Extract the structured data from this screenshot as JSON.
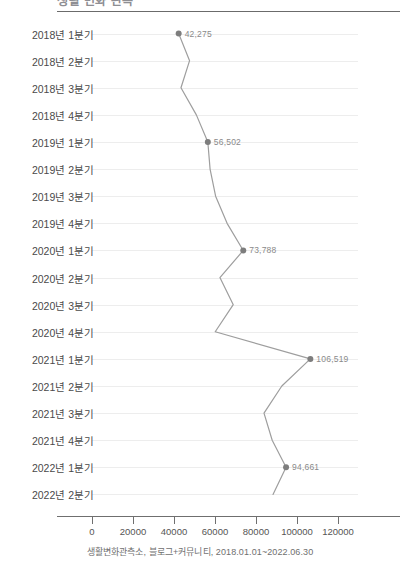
{
  "header": {
    "title": "생활 변화 관측",
    "rule_color": "#6b6b6b"
  },
  "footer": {
    "caption": "생활변화관측소, 블로그+커뮤니티, 2018.01.01~2022.06.30"
  },
  "style": {
    "line_color": "#9e9e9e",
    "marker_color": "#7d7d7d",
    "grid_color": "#ededed",
    "axis_color": "#6f6f6f",
    "label_color": "#8a8a8a"
  },
  "chart_data": {
    "type": "line",
    "orientation": "horizontal",
    "title": "생활 변화 관측",
    "xlabel": "",
    "ylabel": "",
    "xlim": [
      0,
      120000
    ],
    "xticks": [
      "0",
      "20000",
      "40000",
      "60000",
      "80000",
      "100000",
      "120000"
    ],
    "xtick_values": [
      0,
      20000,
      40000,
      60000,
      80000,
      100000,
      120000
    ],
    "grid": true,
    "legend": "none",
    "categories": [
      "2018년 1분기",
      "2018년 2분기",
      "2018년 3분기",
      "2018년 4분기",
      "2019년 1분기",
      "2019년 2분기",
      "2019년 3분기",
      "2019년 4분기",
      "2020년 1분기",
      "2020년 2분기",
      "2020년 3분기",
      "2020년 4분기",
      "2021년 1분기",
      "2021년 2분기",
      "2021년 3분기",
      "2021년 4분기",
      "2022년 1분기",
      "2022년 2분기"
    ],
    "values": [
      42275,
      47600,
      43400,
      50900,
      56502,
      57600,
      60300,
      65900,
      73788,
      62400,
      68900,
      60100,
      106519,
      92600,
      83900,
      87900,
      94661,
      88300
    ],
    "point_labels": [
      {
        "index": 0,
        "text": "42,275"
      },
      {
        "index": 4,
        "text": "56,502"
      },
      {
        "index": 8,
        "text": "73,788"
      },
      {
        "index": 12,
        "text": "106,519"
      },
      {
        "index": 16,
        "text": "94,661"
      }
    ]
  }
}
